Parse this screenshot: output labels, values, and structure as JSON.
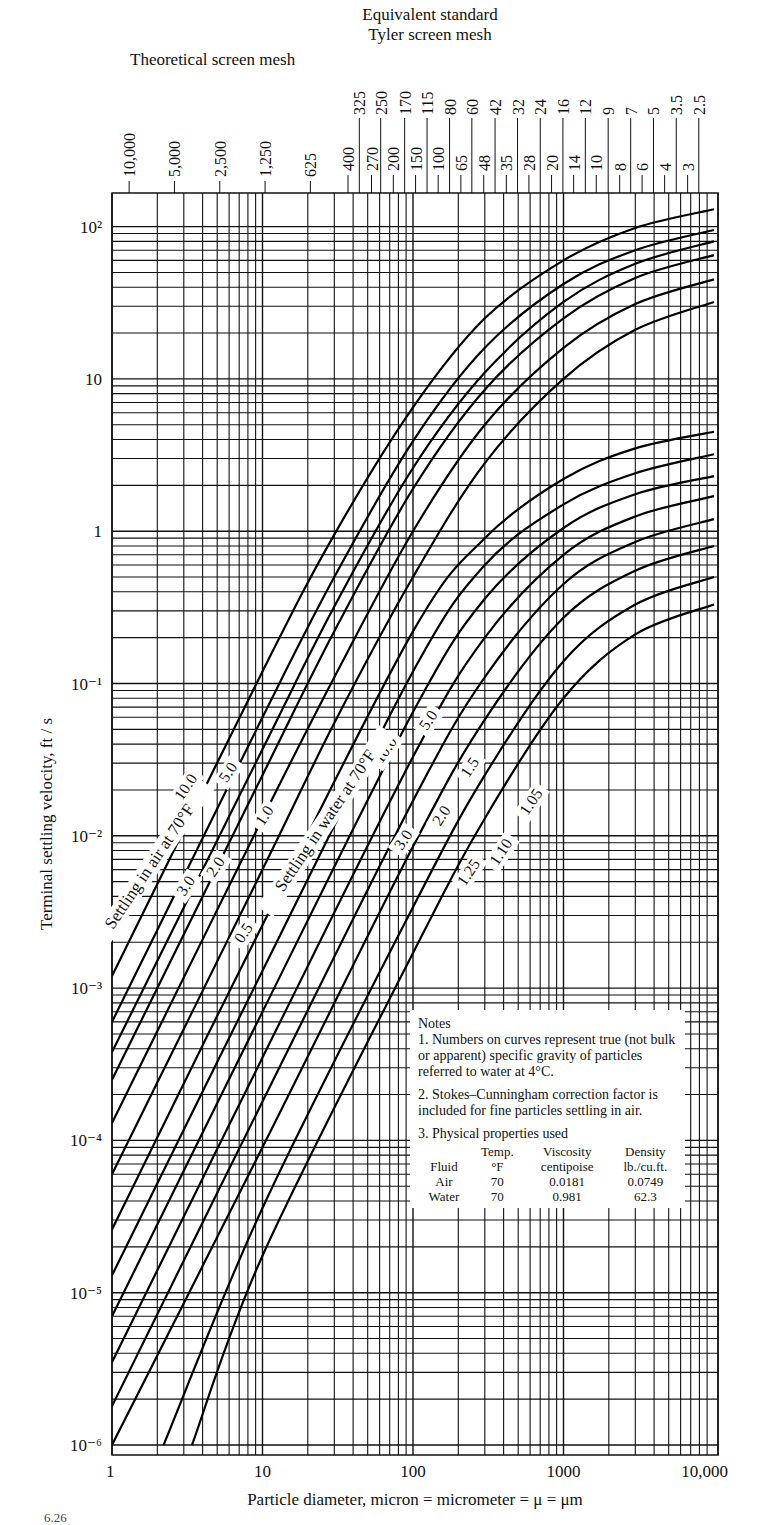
{
  "header": {
    "tyler_title_line1": "Equivalent standard",
    "tyler_title_line2": "Tyler screen mesh",
    "theoretical_title": "Theoretical screen mesh"
  },
  "notes": {
    "heading": "Notes",
    "note1": "1.  Numbers on curves represent true (not bulk or apparent) specific gravity of particles referred to water at 4°C.",
    "note2": "2.  Stokes–Cunningham correction factor is included for fine particles settling in air.",
    "note3": "3.  Physical properties used",
    "table": {
      "headers": [
        [
          "",
          "Temp.",
          "Viscosity",
          "Density"
        ],
        [
          "Fluid",
          "°F",
          "centipoise",
          "lb./cu.ft."
        ]
      ],
      "rows": [
        [
          "Air",
          "70",
          "0.0181",
          "0.0749"
        ],
        [
          "Water",
          "70",
          "0.981",
          "62.3"
        ]
      ]
    }
  },
  "caption_fragment": "6.26",
  "chart_data": {
    "type": "line",
    "xlabel": "Particle diameter, micron = micrometer = μ = μm",
    "ylabel": "Terminal settling velocity, ft / s",
    "xscale": "log",
    "yscale": "log",
    "xlim": [
      1,
      10000
    ],
    "ylim": [
      1e-06,
      200
    ],
    "grid": true,
    "x_ticks": [
      {
        "v": 1,
        "label": "1"
      },
      {
        "v": 10,
        "label": "10"
      },
      {
        "v": 100,
        "label": "100"
      },
      {
        "v": 1000,
        "label": "1000"
      },
      {
        "v": 10000,
        "label": "10,000"
      }
    ],
    "y_ticks": [
      {
        "v": 100,
        "label": "10²"
      },
      {
        "v": 10,
        "label": "10"
      },
      {
        "v": 1,
        "label": "1"
      },
      {
        "v": 0.1,
        "label": "10⁻¹"
      },
      {
        "v": 0.01,
        "label": "10⁻²"
      },
      {
        "v": 0.001,
        "label": "10⁻³"
      },
      {
        "v": 0.0001,
        "label": "10⁻⁴"
      },
      {
        "v": 1e-05,
        "label": "10⁻⁵"
      },
      {
        "v": 1e-06,
        "label": "10⁻⁶"
      }
    ],
    "theoretical_mesh_ticks": [
      {
        "label": "10,000",
        "d": 1.3
      },
      {
        "label": "5,000",
        "d": 2.6
      },
      {
        "label": "2,500",
        "d": 5.2
      },
      {
        "label": "1,250",
        "d": 10.4
      },
      {
        "label": "625",
        "d": 20.8
      }
    ],
    "tyler_mesh_upper": [
      {
        "label": "325",
        "d": 44
      },
      {
        "label": "250",
        "d": 61
      },
      {
        "label": "170",
        "d": 88
      },
      {
        "label": "115",
        "d": 124
      },
      {
        "label": "80",
        "d": 175
      },
      {
        "label": "60",
        "d": 246
      },
      {
        "label": "42",
        "d": 351
      },
      {
        "label": "32",
        "d": 495
      },
      {
        "label": "24",
        "d": 701
      },
      {
        "label": "16",
        "d": 991
      },
      {
        "label": "12",
        "d": 1397
      },
      {
        "label": "9",
        "d": 1981
      },
      {
        "label": "7",
        "d": 2794
      },
      {
        "label": "5",
        "d": 3962
      },
      {
        "label": "3.5",
        "d": 5613
      },
      {
        "label": "2.5",
        "d": 7925
      }
    ],
    "tyler_mesh_lower": [
      {
        "label": "400",
        "d": 37
      },
      {
        "label": "270",
        "d": 53
      },
      {
        "label": "200",
        "d": 74
      },
      {
        "label": "150",
        "d": 104
      },
      {
        "label": "100",
        "d": 147
      },
      {
        "label": "65",
        "d": 208
      },
      {
        "label": "48",
        "d": 295
      },
      {
        "label": "35",
        "d": 417
      },
      {
        "label": "28",
        "d": 589
      },
      {
        "label": "20",
        "d": 833
      },
      {
        "label": "14",
        "d": 1168
      },
      {
        "label": "10",
        "d": 1651
      },
      {
        "label": "8",
        "d": 2362
      },
      {
        "label": "6",
        "d": 3327
      },
      {
        "label": "4",
        "d": 4699
      },
      {
        "label": "3",
        "d": 6680
      }
    ],
    "group_labels": [
      {
        "text": "Settling in air at 70°F",
        "d": 1.9,
        "v": 0.006,
        "angle": -56
      },
      {
        "text": "Settling in water at 70°F",
        "d": 28,
        "v": 0.012,
        "angle": -56
      }
    ],
    "series": [
      {
        "name": "Air SG 10.0",
        "fluid": "air",
        "sg": "10.0",
        "label_at": {
          "d": 3.3,
          "v": 0.02
        },
        "points": [
          [
            1,
            0.0012
          ],
          [
            10,
            0.12
          ],
          [
            30,
            0.95
          ],
          [
            100,
            6.5
          ],
          [
            300,
            25
          ],
          [
            1000,
            60
          ],
          [
            3000,
            98
          ],
          [
            10000,
            130
          ]
        ]
      },
      {
        "name": "Air SG 5.0",
        "fluid": "air",
        "sg": "5.0",
        "label_at": {
          "d": 6.3,
          "v": 0.025
        },
        "points": [
          [
            1,
            0.0006
          ],
          [
            10,
            0.06
          ],
          [
            30,
            0.5
          ],
          [
            100,
            3.9
          ],
          [
            300,
            16
          ],
          [
            1000,
            42
          ],
          [
            3000,
            70
          ],
          [
            10000,
            95
          ]
        ]
      },
      {
        "name": "Air SG 3.0",
        "fluid": "air",
        "sg": "3.0",
        "label_at": {
          "d": 3.3,
          "v": 0.0045
        },
        "points": [
          [
            1,
            0.00038
          ],
          [
            10,
            0.037
          ],
          [
            30,
            0.32
          ],
          [
            100,
            2.6
          ],
          [
            300,
            11
          ],
          [
            1000,
            32
          ],
          [
            3000,
            57
          ],
          [
            10000,
            80
          ]
        ]
      },
      {
        "name": "Air SG 2.0",
        "fluid": "air",
        "sg": "2.0",
        "label_at": {
          "d": 5.2,
          "v": 0.006
        },
        "points": [
          [
            1,
            0.00025
          ],
          [
            10,
            0.025
          ],
          [
            30,
            0.22
          ],
          [
            100,
            1.9
          ],
          [
            300,
            8.5
          ],
          [
            1000,
            25
          ],
          [
            3000,
            46
          ],
          [
            10000,
            65
          ]
        ]
      },
      {
        "name": "Air SG 1.0",
        "fluid": "air",
        "sg": "1.0",
        "label_at": {
          "d": 11,
          "v": 0.013
        },
        "points": [
          [
            1,
            0.00013
          ],
          [
            10,
            0.013
          ],
          [
            30,
            0.11
          ],
          [
            100,
            1.0
          ],
          [
            300,
            5.0
          ],
          [
            1000,
            16
          ],
          [
            3000,
            31
          ],
          [
            10000,
            45
          ]
        ]
      },
      {
        "name": "Air SG 0.5",
        "fluid": "air",
        "sg": "0.5",
        "label_at": {
          "d": 8,
          "v": 0.0022
        },
        "points": [
          [
            1,
            6e-05
          ],
          [
            10,
            0.006
          ],
          [
            30,
            0.055
          ],
          [
            100,
            0.5
          ],
          [
            300,
            2.8
          ],
          [
            1000,
            10
          ],
          [
            3000,
            21
          ],
          [
            10000,
            32
          ]
        ]
      },
      {
        "name": "Water SG 10.0",
        "fluid": "water",
        "sg": "10.0",
        "label_at": {
          "d": 70,
          "v": 0.035
        },
        "points": [
          [
            1,
            2.6e-05
          ],
          [
            10,
            0.0026
          ],
          [
            100,
            0.22
          ],
          [
            300,
            0.9
          ],
          [
            1000,
            2.2
          ],
          [
            3000,
            3.5
          ],
          [
            10000,
            4.5
          ]
        ]
      },
      {
        "name": "Water SG 5.0",
        "fluid": "water",
        "sg": "5.0",
        "label_at": {
          "d": 135,
          "v": 0.055
        },
        "points": [
          [
            1,
            1.3e-05
          ],
          [
            10,
            0.0013
          ],
          [
            100,
            0.12
          ],
          [
            300,
            0.6
          ],
          [
            1000,
            1.5
          ],
          [
            3000,
            2.4
          ],
          [
            10000,
            3.2
          ]
        ]
      },
      {
        "name": "Water SG 3.0",
        "fluid": "water",
        "sg": "3.0",
        "label_at": {
          "d": 92,
          "v": 0.009
        },
        "points": [
          [
            1,
            7e-06
          ],
          [
            10,
            0.0007
          ],
          [
            100,
            0.065
          ],
          [
            300,
            0.36
          ],
          [
            1000,
            1.05
          ],
          [
            3000,
            1.75
          ],
          [
            10000,
            2.3
          ]
        ]
      },
      {
        "name": "Water SG 2.0",
        "fluid": "water",
        "sg": "2.0",
        "label_at": {
          "d": 165,
          "v": 0.013
        },
        "points": [
          [
            1,
            3.5e-06
          ],
          [
            10,
            0.00035
          ],
          [
            100,
            0.033
          ],
          [
            300,
            0.2
          ],
          [
            1000,
            0.7
          ],
          [
            3000,
            1.25
          ],
          [
            10000,
            1.7
          ]
        ]
      },
      {
        "name": "Water SG 1.5",
        "fluid": "water",
        "sg": "1.5",
        "label_at": {
          "d": 255,
          "v": 0.027
        },
        "points": [
          [
            1,
            1.8e-06
          ],
          [
            10,
            0.00018
          ],
          [
            100,
            0.017
          ],
          [
            300,
            0.11
          ],
          [
            1000,
            0.45
          ],
          [
            3000,
            0.85
          ],
          [
            10000,
            1.2
          ]
        ]
      },
      {
        "name": "Water SG 1.25",
        "fluid": "water",
        "sg": "1.25",
        "label_at": {
          "d": 250,
          "v": 0.0055
        },
        "points": [
          [
            1,
            1e-06
          ],
          [
            10,
            9e-05
          ],
          [
            100,
            0.0085
          ],
          [
            300,
            0.058
          ],
          [
            1000,
            0.27
          ],
          [
            3000,
            0.55
          ],
          [
            10000,
            0.8
          ]
        ]
      },
      {
        "name": "Water SG 1.10",
        "fluid": "water",
        "sg": "1.10",
        "label_at": {
          "d": 410,
          "v": 0.0075
        },
        "points": [
          [
            2.2,
            1e-06
          ],
          [
            10,
            3.6e-05
          ],
          [
            100,
            0.0034
          ],
          [
            300,
            0.025
          ],
          [
            1000,
            0.14
          ],
          [
            3000,
            0.33
          ],
          [
            10000,
            0.5
          ]
        ]
      },
      {
        "name": "Water SG 1.05",
        "fluid": "water",
        "sg": "1.05",
        "label_at": {
          "d": 650,
          "v": 0.016
        },
        "points": [
          [
            3.4,
            1e-06
          ],
          [
            10,
            1.75e-05
          ],
          [
            100,
            0.0017
          ],
          [
            300,
            0.013
          ],
          [
            1000,
            0.08
          ],
          [
            3000,
            0.21
          ],
          [
            10000,
            0.33
          ]
        ]
      }
    ]
  }
}
